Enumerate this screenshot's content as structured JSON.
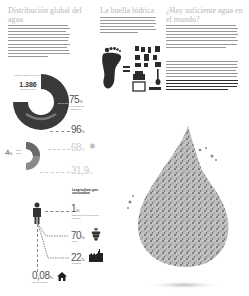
{
  "columns": [
    {
      "title": "Distribución global del agua",
      "text_lines": 11
    },
    {
      "title": "La huella hídrica",
      "text_lines": 6
    },
    {
      "title": "¿Hay suficiente agua en el mundo?",
      "text_lines_1": 8,
      "text_lines_2": 6,
      "text_lines_bold": 4
    }
  ],
  "donut": {
    "caption": "Total de agua en la Tierra",
    "value": "1.386",
    "unit": "billones de km³",
    "ring_label": "agua salada",
    "colors": {
      "salt": "#3a3a3a",
      "fresh": "#777777"
    }
  },
  "stats": [
    {
      "value": "75",
      "suffix": "%",
      "note": "en glaciares y casquetes",
      "light": false
    },
    {
      "value": "96",
      "suffix": "%",
      "note": "",
      "light": false
    },
    {
      "value": "68",
      "suffix": "%",
      "note": "",
      "light": true,
      "icon": "snowflake-icon"
    },
    {
      "value": "31,9",
      "suffix": "%",
      "note": "",
      "light": true
    }
  ],
  "fresh": {
    "value": "4",
    "suffix": "%",
    "label": "agua dulce"
  },
  "consumption": {
    "heading": "La agricultura, gran consumidora",
    "items": [
      {
        "value": "1",
        "suffix": "%",
        "note": "disponible para consumo humano",
        "icon": "person-icon"
      },
      {
        "value": "70",
        "suffix": "%",
        "note": "riego",
        "icon": "grapes-icon"
      },
      {
        "value": "22",
        "suffix": "%",
        "note": "industria",
        "icon": "factory-icon"
      },
      {
        "value": "0,08",
        "suffix": "%",
        "note": "uso doméstico",
        "icon": "house-icon"
      }
    ]
  }
}
